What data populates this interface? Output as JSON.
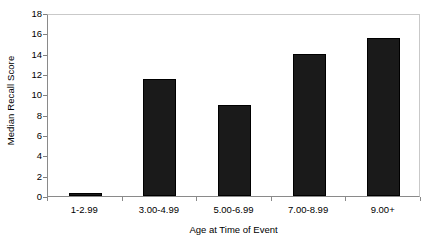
{
  "chart_data": {
    "type": "bar",
    "title": "",
    "categories": [
      "1-2.99",
      "3.00-4.99",
      "5.00-6.99",
      "7.00-8.99",
      "9.00+"
    ],
    "values": [
      0.15,
      11.5,
      9.0,
      14.0,
      15.5
    ],
    "xlabel": "Age at Time of Event",
    "ylabel": "Median Recall Score",
    "ylim": [
      0,
      18
    ],
    "ytick_step": 2,
    "yticks": [
      "0",
      "2",
      "4",
      "6",
      "8",
      "10",
      "12",
      "14",
      "16",
      "18"
    ],
    "grid": false,
    "legend": false,
    "bar_color": "#1a1a1a",
    "axis_color": "#8a8a8a",
    "background_color": "#ffffff"
  }
}
